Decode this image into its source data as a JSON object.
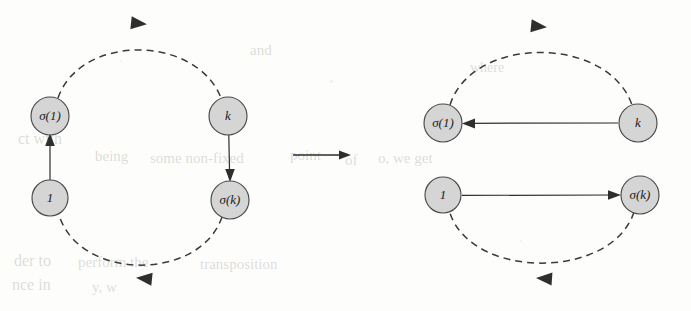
{
  "figure": {
    "background_color": "#fdfdfc",
    "node_fill": "#d5d5d5",
    "node_stroke": "#4a4a4a",
    "edge_color": "#2e2e2e"
  },
  "left_graph": {
    "name": "before",
    "nodes": [
      {
        "id": "sigma1",
        "label": "σ(1)",
        "cx": 50,
        "cy": 116,
        "r": 19
      },
      {
        "id": "one",
        "label": "1",
        "cx": 50,
        "cy": 198,
        "r": 18
      },
      {
        "id": "k",
        "label": "k",
        "cx": 228,
        "cy": 116,
        "r": 19
      },
      {
        "id": "sigmak",
        "label": "σ(k)",
        "cx": 230,
        "cy": 200,
        "r": 19
      }
    ],
    "edges": [
      {
        "id": "one-to-sigma1",
        "from": "one",
        "to": "sigma1",
        "style": "solid",
        "direction": "up"
      },
      {
        "id": "k-to-sigmak",
        "from": "k",
        "to": "sigmak",
        "style": "solid",
        "direction": "down"
      },
      {
        "id": "sigma1-to-k",
        "from": "sigma1",
        "to": "k",
        "style": "dashed",
        "direction": "arc-top-right"
      },
      {
        "id": "sigmak-to-one",
        "from": "sigmak",
        "to": "one",
        "style": "dashed",
        "direction": "arc-bottom-left"
      }
    ]
  },
  "transform": {
    "name": "maps-to-arrow",
    "symbol": "⟶"
  },
  "right_graph": {
    "name": "after",
    "nodes": [
      {
        "id": "sigma1",
        "label": "σ(1)",
        "cx": 443,
        "cy": 123,
        "r": 19
      },
      {
        "id": "one",
        "label": "1",
        "cx": 443,
        "cy": 195,
        "r": 18
      },
      {
        "id": "k",
        "label": "k",
        "cx": 638,
        "cy": 123,
        "r": 19
      },
      {
        "id": "sigmak",
        "label": "σ(k)",
        "cx": 640,
        "cy": 195,
        "r": 19
      }
    ],
    "edges": [
      {
        "id": "k-to-sigma1",
        "from": "k",
        "to": "sigma1",
        "style": "solid",
        "direction": "left"
      },
      {
        "id": "one-to-sigmak",
        "from": "one",
        "to": "sigmak",
        "style": "solid",
        "direction": "right"
      },
      {
        "id": "sigma1-to-k",
        "from": "sigma1",
        "to": "k",
        "style": "dashed",
        "direction": "arc-top-right"
      },
      {
        "id": "sigmak-to-one",
        "from": "sigmak",
        "to": "one",
        "style": "dashed",
        "direction": "arc-bottom-left"
      }
    ]
  },
  "labels": {
    "sigma1": "σ(1)",
    "one": "1",
    "k": "k",
    "sigmak": "σ(k)"
  }
}
